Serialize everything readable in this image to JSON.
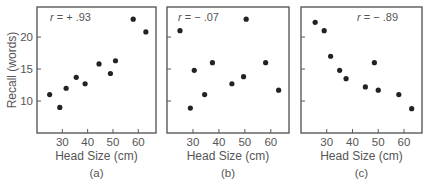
{
  "figure": {
    "y_axis_label": "Recall (words)",
    "x_axis_label": "Head Size (cm)"
  },
  "chart_data": [
    {
      "type": "scatter",
      "panel_label": "(a)",
      "annotation": "r = + .93",
      "xlabel": "Head Size (cm)",
      "ylabel": "Recall (words)",
      "xticks": [
        30,
        40,
        50,
        60
      ],
      "yticks": [
        10,
        15,
        20
      ],
      "xlim": [
        20,
        67
      ],
      "ylim": [
        5,
        24.7
      ],
      "grid": false,
      "points": [
        {
          "x": 25,
          "y": 11
        },
        {
          "x": 29,
          "y": 9
        },
        {
          "x": 31.5,
          "y": 12
        },
        {
          "x": 35.5,
          "y": 13.7
        },
        {
          "x": 39,
          "y": 12.7
        },
        {
          "x": 44.5,
          "y": 15.8
        },
        {
          "x": 49,
          "y": 14.3
        },
        {
          "x": 51,
          "y": 16.3
        },
        {
          "x": 58,
          "y": 22.8
        },
        {
          "x": 63,
          "y": 20.8
        }
      ]
    },
    {
      "type": "scatter",
      "panel_label": "(b)",
      "annotation": "r = − .07",
      "xlabel": "Head Size (cm)",
      "ylabel": "Recall (words)",
      "xticks": [
        30,
        40,
        50,
        60
      ],
      "yticks": [
        10,
        15,
        20
      ],
      "xlim": [
        20,
        67
      ],
      "ylim": [
        5,
        24.7
      ],
      "grid": false,
      "points": [
        {
          "x": 25,
          "y": 21
        },
        {
          "x": 29,
          "y": 8.9
        },
        {
          "x": 30.5,
          "y": 14.8
        },
        {
          "x": 34.5,
          "y": 11
        },
        {
          "x": 37.5,
          "y": 16
        },
        {
          "x": 45,
          "y": 12.7
        },
        {
          "x": 49.5,
          "y": 13.8
        },
        {
          "x": 50.5,
          "y": 22.8
        },
        {
          "x": 58,
          "y": 16
        },
        {
          "x": 63,
          "y": 11.7
        }
      ]
    },
    {
      "type": "scatter",
      "panel_label": "(c)",
      "annotation": "r = − .89",
      "xlabel": "Head Size (cm)",
      "ylabel": "Recall (words)",
      "xticks": [
        30,
        40,
        50,
        60
      ],
      "yticks": [
        10,
        15,
        20
      ],
      "xlim": [
        20,
        67
      ],
      "ylim": [
        5,
        24.7
      ],
      "grid": false,
      "points": [
        {
          "x": 25.5,
          "y": 22.3
        },
        {
          "x": 29,
          "y": 21
        },
        {
          "x": 31.5,
          "y": 17
        },
        {
          "x": 35,
          "y": 14.8
        },
        {
          "x": 37.5,
          "y": 13.5
        },
        {
          "x": 45,
          "y": 12.2
        },
        {
          "x": 48.5,
          "y": 16
        },
        {
          "x": 50,
          "y": 11.7
        },
        {
          "x": 58,
          "y": 11
        },
        {
          "x": 63,
          "y": 8.8
        }
      ]
    }
  ],
  "layout": {
    "panels": [
      {
        "left": 37,
        "top": 7,
        "right": 156,
        "bottom": 133,
        "annotation_x": 50,
        "annotation_anchor": "start"
      },
      {
        "left": 167,
        "top": 7,
        "right": 289,
        "bottom": 133,
        "annotation_x": 178,
        "annotation_anchor": "start"
      },
      {
        "left": 301,
        "top": 7,
        "right": 422,
        "bottom": 133,
        "annotation_x": 398,
        "annotation_anchor": "end"
      }
    ]
  }
}
